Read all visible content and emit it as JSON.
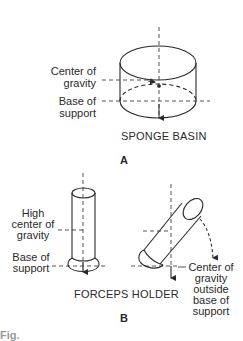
{
  "figure": {
    "panel_a": {
      "letter": "A",
      "title": "SPONGE BASIN",
      "labels": {
        "center_of_gravity": [
          "Center of",
          "gravity"
        ],
        "base_of_support": [
          "Base of",
          "support"
        ]
      }
    },
    "panel_b": {
      "letter": "B",
      "title": "FORCEPS HOLDER",
      "labels": {
        "high_center_of_gravity": [
          "High",
          "center of",
          "gravity"
        ],
        "base_of_support": [
          "Base of",
          "support"
        ],
        "cg_outside": [
          "Center of",
          "gravity",
          "outside",
          "base of",
          "support"
        ]
      }
    },
    "caption_fragment": "Fig."
  },
  "colors": {
    "line": "#2a2a2a",
    "background": "#ffffff"
  }
}
